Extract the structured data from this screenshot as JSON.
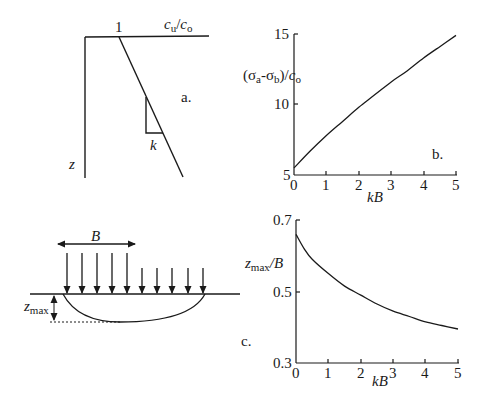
{
  "panel_a": {
    "tag": "a.",
    "x_label_main": "c",
    "x_label_sub": "u",
    "x_label_slash": "/",
    "x_label_main2": "c",
    "x_label_sub2": "o",
    "intercept_label": "1",
    "slope_label": "k",
    "z_axis_label": "z"
  },
  "panel_b": {
    "tag": "b.",
    "ylabel_open": "(σ",
    "ylabel_sub_a": "a",
    "ylabel_dash": "-σ",
    "ylabel_sub_b": "b",
    "ylabel_close": ")/",
    "ylabel_c": "c",
    "ylabel_sub_o": "o",
    "xlabel": "kB",
    "yticks": [
      "15",
      "10",
      "5"
    ],
    "xticks": [
      "0",
      "1",
      "2",
      "3",
      "4",
      "5"
    ]
  },
  "panel_c": {
    "tag": "c.",
    "width_label": "B",
    "depth_label_main": "z",
    "depth_label_sub": "max",
    "ylabel_main": "z",
    "ylabel_sub": "max",
    "ylabel_rest": "/B",
    "xlabel": "kB",
    "yticks": [
      "0.7",
      "0.5",
      "0.3"
    ],
    "xticks": [
      "0",
      "1",
      "2",
      "3",
      "4",
      "5"
    ]
  },
  "chart_data": [
    {
      "type": "line",
      "panel": "b",
      "title": "",
      "xlabel": "kB",
      "ylabel": "(σa-σb)/co",
      "xlim": [
        0,
        5
      ],
      "ylim": [
        5,
        15
      ],
      "xticks": [
        0,
        1,
        2,
        3,
        4,
        5
      ],
      "yticks": [
        5,
        10,
        15
      ],
      "grid": false,
      "series": [
        {
          "name": "(σa-σb)/co",
          "x": [
            0,
            0.5,
            1,
            1.5,
            2,
            2.5,
            3,
            3.5,
            4,
            4.5,
            5
          ],
          "values": [
            5.5,
            6.7,
            7.8,
            8.8,
            9.8,
            10.7,
            11.6,
            12.4,
            13.3,
            14.1,
            14.9
          ]
        }
      ]
    },
    {
      "type": "line",
      "panel": "c",
      "title": "",
      "xlabel": "kB",
      "ylabel": "zmax/B",
      "xlim": [
        0,
        5
      ],
      "ylim": [
        0.3,
        0.7
      ],
      "xticks": [
        0,
        1,
        2,
        3,
        4,
        5
      ],
      "yticks": [
        0.3,
        0.5,
        0.7
      ],
      "grid": false,
      "series": [
        {
          "name": "zmax/B",
          "x": [
            0,
            0.25,
            0.5,
            1,
            1.5,
            2,
            2.5,
            3,
            3.5,
            4,
            4.5,
            5
          ],
          "values": [
            0.66,
            0.62,
            0.59,
            0.55,
            0.515,
            0.49,
            0.465,
            0.445,
            0.43,
            0.415,
            0.405,
            0.395
          ]
        }
      ]
    }
  ]
}
